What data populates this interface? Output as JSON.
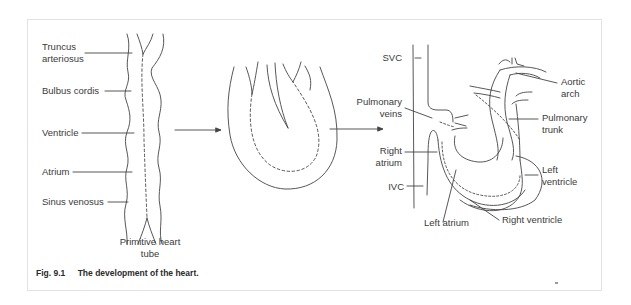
{
  "figure": {
    "number": "Fig. 9.1",
    "title": "The development of the heart."
  },
  "panels": [
    {
      "name": "Primitive heart tube",
      "caption_lines": [
        "Primitive heart",
        "tube"
      ],
      "labels": [
        {
          "lines": [
            "Truncus",
            "arteriosus"
          ]
        },
        {
          "lines": [
            "Bulbus cordis"
          ]
        },
        {
          "lines": [
            "Ventricle"
          ]
        },
        {
          "lines": [
            "Atrium"
          ]
        },
        {
          "lines": [
            "Sinus venosus"
          ]
        }
      ]
    },
    {
      "name": "Looping heart tube",
      "labels": []
    },
    {
      "name": "Developed heart",
      "labels": [
        {
          "lines": [
            "SVC"
          ]
        },
        {
          "lines": [
            "Pulmonary",
            "veins"
          ]
        },
        {
          "lines": [
            "Right",
            "atrium"
          ]
        },
        {
          "lines": [
            "IVC"
          ]
        },
        {
          "lines": [
            "Left atrium"
          ]
        },
        {
          "lines": [
            "Right ventricle"
          ]
        },
        {
          "lines": [
            "Left",
            "ventricle"
          ]
        },
        {
          "lines": [
            "Pulmonary",
            "trunk"
          ]
        },
        {
          "lines": [
            "Aortic",
            "arch"
          ]
        }
      ]
    }
  ],
  "arrows": [
    {
      "from": "Primitive heart tube",
      "to": "Looping heart tube"
    },
    {
      "from": "Looping heart tube",
      "to": "Developed heart"
    }
  ],
  "colors": {
    "line": "#444444",
    "text": "#3a3a3a",
    "frame": "#e2e2e2"
  }
}
